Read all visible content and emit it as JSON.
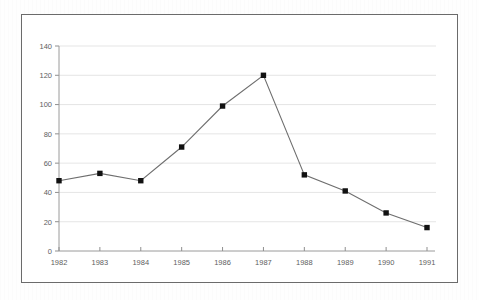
{
  "chart_data": {
    "type": "line",
    "title": "",
    "subtitle": "",
    "xlabel": "",
    "ylabel": "",
    "categories": [
      "1982",
      "1983",
      "1984",
      "1985",
      "1986",
      "1987",
      "1988",
      "1989",
      "1990",
      "1991"
    ],
    "values": [
      48,
      53,
      48,
      71,
      99,
      120,
      52,
      41,
      26,
      16
    ],
    "series": [
      {
        "name": "",
        "values": [
          48,
          53,
          48,
          71,
          99,
          120,
          52,
          41,
          26,
          16
        ]
      }
    ],
    "xlim": [
      "1982",
      "1991"
    ],
    "ylim": [
      0,
      140
    ],
    "ytick_labels": [
      "0",
      "20",
      "40",
      "60",
      "80",
      "100",
      "120",
      "140"
    ],
    "ytick_values": [
      0,
      20,
      40,
      60,
      80,
      100,
      120,
      140
    ],
    "xtick_labels": [
      "1982",
      "1983",
      "1984",
      "1985",
      "1986",
      "1987",
      "1988",
      "1989",
      "1990",
      "1991"
    ],
    "grid": "horizontal",
    "legend": "none",
    "annotations": [],
    "marker": "square",
    "colors": {
      "line": "#6e6e6e",
      "marker": "#111111",
      "gridline": "#dedede",
      "axis": "#9a9a9a",
      "tick_text": "#5e5e5e",
      "frame_border": "#6b6b6b",
      "background": "#ffffff"
    }
  }
}
